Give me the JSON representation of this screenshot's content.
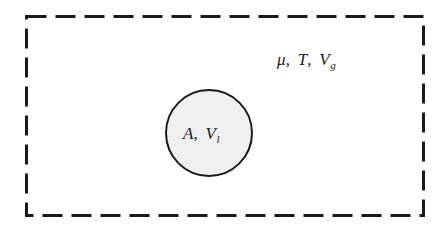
{
  "figure": {
    "background_color": "#ffffff",
    "stroke_color": "#1a1a1a",
    "circle_fill_color": "#f0f0f0"
  },
  "outer_region": {
    "name": "gas-phase-region",
    "border_style": "dashed",
    "label": {
      "full_text": "μ, T, V_g",
      "symbols": [
        {
          "base": "μ",
          "sub": ""
        },
        {
          "base": "T",
          "sub": ""
        },
        {
          "base": "V",
          "sub": "g"
        }
      ],
      "separator": ","
    }
  },
  "inner_region": {
    "name": "liquid-droplet",
    "shape": "circle",
    "label": {
      "full_text": "A, V_l",
      "symbols": [
        {
          "base": "A",
          "sub": ""
        },
        {
          "base": "V",
          "sub": "l"
        }
      ],
      "separator": ","
    }
  }
}
